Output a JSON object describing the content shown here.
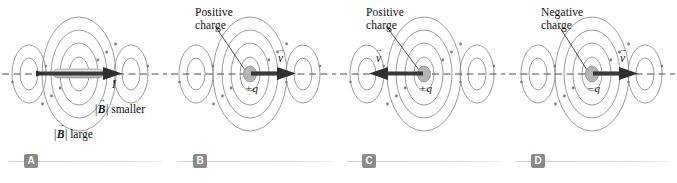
{
  "figure": {
    "panels": [
      {
        "id": "a",
        "badge": "A",
        "source_type": "current-carrying-wire",
        "current_label": "I",
        "field_label_large": "large",
        "field_label_small": "smaller",
        "field_symbol": "B",
        "bar_left": "|",
        "bar_right": "|",
        "charge_label": "",
        "charge_caption": "",
        "velocity_label": "v",
        "velocity_direction": "right"
      },
      {
        "id": "b",
        "badge": "B",
        "source_type": "moving-point-charge",
        "charge_caption": "Positive\ncharge",
        "charge_label": "+q",
        "velocity_label": "v",
        "velocity_direction": "right"
      },
      {
        "id": "c",
        "badge": "C",
        "source_type": "moving-point-charge",
        "charge_caption": "Positive\ncharge",
        "charge_label": "+q",
        "velocity_label": "v",
        "velocity_direction": "left"
      },
      {
        "id": "d",
        "badge": "D",
        "source_type": "moving-point-charge",
        "charge_caption": "Negative\ncharge",
        "charge_label": "−q",
        "velocity_label": "v",
        "velocity_direction": "right"
      }
    ],
    "colors": {
      "field_line": "#8a8a8a",
      "axis_dash": "#4a4a4a",
      "arrow": "#3a3a3a",
      "charge_fill": "#b5b5b5",
      "wire_fill": "#c9c9c9",
      "badge_bg": "#8a8a8a",
      "badge_text": "#ffffff",
      "rule": "#d5d5d5",
      "background": "#ffffff"
    }
  }
}
